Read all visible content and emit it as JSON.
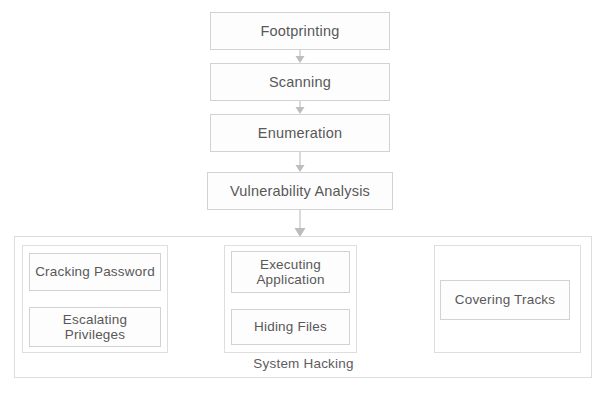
{
  "diagram": {
    "background_color": "#ffffff",
    "line_color": "#bdbdbd",
    "box_border_color": "#d2d2d2",
    "text_color": "#585858",
    "stages": [
      {
        "id": "footprinting",
        "label": "Footprinting"
      },
      {
        "id": "scanning",
        "label": "Scanning"
      },
      {
        "id": "enumeration",
        "label": "Enumeration"
      },
      {
        "id": "vulnerability_analysis",
        "label": "Vulnerability Analysis"
      }
    ],
    "container": {
      "label": "System Hacking",
      "groups": [
        {
          "id": "gaining_access",
          "nodes": [
            {
              "id": "cracking_password",
              "label": "Cracking Password"
            },
            {
              "id": "escalating_privileges",
              "label": "Escalating\nPrivileges",
              "line1": "Escalating",
              "line2": "Privileges"
            }
          ]
        },
        {
          "id": "maintaining_access",
          "nodes": [
            {
              "id": "executing_application",
              "label": "Executing\nApplication",
              "line1": "Executing",
              "line2": "Application"
            },
            {
              "id": "hiding_files",
              "label": "Hiding Files"
            }
          ]
        },
        {
          "id": "covering",
          "nodes": [
            {
              "id": "covering_tracks",
              "label": "Covering Tracks"
            }
          ]
        }
      ]
    },
    "connections": [
      {
        "from": "footprinting",
        "to": "scanning",
        "direction": "down"
      },
      {
        "from": "scanning",
        "to": "enumeration",
        "direction": "down"
      },
      {
        "from": "enumeration",
        "to": "vulnerability_analysis",
        "direction": "down"
      },
      {
        "from": "vulnerability_analysis",
        "to": "system_hacking",
        "direction": "down"
      },
      {
        "from": "cracking_password",
        "to": "escalating_privileges",
        "direction": "down"
      },
      {
        "from": "gaining_access",
        "to": "maintaining_access",
        "direction": "right"
      },
      {
        "from": "executing_application",
        "to": "hiding_files",
        "direction": "down"
      },
      {
        "from": "maintaining_access",
        "to": "covering_tracks",
        "direction": "right"
      }
    ]
  }
}
